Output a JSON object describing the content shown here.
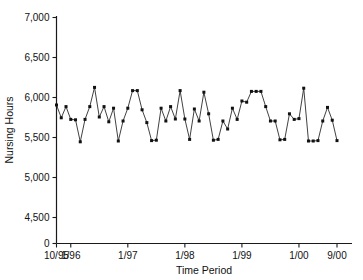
{
  "chart_data": {
    "type": "line",
    "title": "",
    "xlabel": "Time Period",
    "ylabel": "Nursing Hours",
    "grid": false,
    "legend": "none",
    "marker": "filled-square",
    "ylim": [
      0,
      7000
    ],
    "y_break_after_zero": true,
    "ytick_labels": [
      "0",
      "4,500",
      "5,000",
      "5,500",
      "6,000",
      "6,500",
      "7,000"
    ],
    "ytick_values": [
      0,
      4500,
      5000,
      5500,
      6000,
      6500,
      7000
    ],
    "xtick_labels": [
      "10/95",
      "1/96",
      "1/97",
      "1/98",
      "1/99",
      "1/00",
      "9/00"
    ],
    "xtick_index": [
      0,
      3,
      15,
      27,
      39,
      51,
      59
    ],
    "x": [
      "10/95",
      "11/95",
      "12/95",
      "1/96",
      "2/96",
      "3/96",
      "4/96",
      "5/96",
      "6/96",
      "7/96",
      "8/96",
      "9/96",
      "10/96",
      "11/96",
      "12/96",
      "1/97",
      "2/97",
      "3/97",
      "4/97",
      "5/97",
      "6/97",
      "7/97",
      "8/97",
      "9/97",
      "10/97",
      "11/97",
      "12/97",
      "1/98",
      "2/98",
      "3/98",
      "4/98",
      "5/98",
      "6/98",
      "7/98",
      "8/98",
      "9/98",
      "10/98",
      "11/98",
      "12/98",
      "1/99",
      "2/99",
      "3/99",
      "4/99",
      "5/99",
      "6/99",
      "7/99",
      "8/99",
      "9/99",
      "10/99",
      "11/99",
      "12/99",
      "1/00",
      "2/00",
      "3/00",
      "4/00",
      "5/00",
      "6/00",
      "7/00",
      "8/00",
      "9/00"
    ],
    "values": [
      5900,
      5740,
      5880,
      5720,
      5715,
      5440,
      5720,
      5880,
      6120,
      5750,
      5880,
      5690,
      5860,
      5450,
      5700,
      5860,
      6080,
      6080,
      5840,
      5680,
      5455,
      5460,
      5860,
      5700,
      5880,
      5725,
      6080,
      5725,
      5470,
      5850,
      5700,
      6060,
      5790,
      5460,
      5470,
      5700,
      5600,
      5860,
      5720,
      5950,
      5935,
      6070,
      6070,
      6070,
      5880,
      5700,
      5700,
      5465,
      5470,
      5790,
      5720,
      5730,
      6110,
      5450,
      5450,
      5455,
      5700,
      5870,
      5710,
      5455
    ],
    "series_name": "Nursing Hours",
    "value_range": [
      5440,
      6120
    ],
    "n_points": 60
  }
}
